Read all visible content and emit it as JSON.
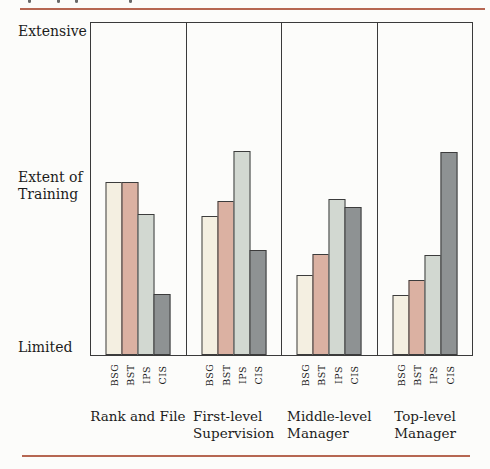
{
  "styles": {
    "background": "#fcfcfa",
    "rule_color": "#b66752",
    "frame_color": "#3a3a3a",
    "text_color": "#1c1c1c"
  },
  "chart_data": {
    "type": "bar",
    "title": "",
    "categories": [
      "Rank and File",
      "First-level\nSupervision",
      "Middle-level\nManager",
      "Top-level\nManager"
    ],
    "series": [
      {
        "name": "BSG",
        "color": "#f4efe1",
        "values": [
          52,
          42,
          24,
          18
        ]
      },
      {
        "name": "BST",
        "color": "#dbb1a2",
        "values": [
          52,
          46.5,
          30.5,
          22.5
        ]
      },
      {
        "name": "IPS",
        "color": "#d2d8d1",
        "values": [
          42.5,
          61.5,
          47,
          30
        ]
      },
      {
        "name": "CIS",
        "color": "#8e9293",
        "values": [
          18.5,
          31.5,
          44.5,
          61
        ]
      }
    ],
    "y_axis_labels": {
      "top": "Extensive",
      "middle": "Extent of\nTraining",
      "bottom": "Limited"
    },
    "ylabel": "Extent of Training",
    "ylim": [
      0,
      100
    ],
    "value_scale_note": "qualitative axis: Limited = 0, Extensive = 100; values estimated from bar heights",
    "grid": false,
    "legend": false
  }
}
